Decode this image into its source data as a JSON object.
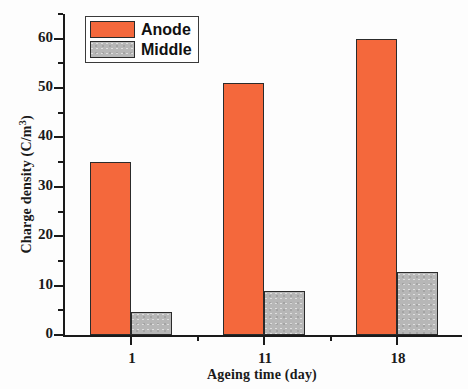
{
  "chart_data": {
    "type": "bar",
    "title": "",
    "xlabel": "Ageing time (day)",
    "ylabel_text": "Charge density (C/m",
    "ylabel_sup": "3",
    "ylabel_tail": ")",
    "ylabel_full": "Charge density (C/m3)",
    "categories": [
      "1",
      "11",
      "18"
    ],
    "series": [
      {
        "name": "Anode",
        "color": "#f4683c",
        "values": [
          35,
          51,
          60
        ]
      },
      {
        "name": "Middle",
        "color": "#b7b7b7",
        "values": [
          4.7,
          9,
          12.8
        ]
      }
    ],
    "ylim": [
      0,
      65
    ],
    "xlim_note": "categorical, 3 groups",
    "y_major_ticks": [
      0,
      10,
      20,
      30,
      40,
      50,
      60
    ],
    "y_minor_ticks": [
      5,
      15,
      25,
      35,
      45,
      55,
      65
    ],
    "y_tick_labels": [
      "0",
      "10",
      "20",
      "30",
      "40",
      "50",
      "60"
    ],
    "x_tick_labels": [
      "1",
      "11",
      "18"
    ],
    "grid": false,
    "legend_position": "top-left inside axes",
    "legend_entries": [
      "Anode",
      "Middle"
    ]
  },
  "axes": {
    "y_ticks": [
      {
        "value": 60,
        "label": "60"
      },
      {
        "value": 50,
        "label": "50"
      },
      {
        "value": 40,
        "label": "40"
      },
      {
        "value": 30,
        "label": "30"
      },
      {
        "value": 20,
        "label": "20"
      },
      {
        "value": 10,
        "label": "10"
      },
      {
        "value": 0,
        "label": "0"
      }
    ],
    "y_minor": [
      65,
      55,
      45,
      35,
      25,
      15,
      5
    ],
    "x_ticks": [
      {
        "label": "1"
      },
      {
        "label": "11"
      },
      {
        "label": "18"
      }
    ]
  },
  "legend": {
    "rows": [
      {
        "label": "Anode",
        "swatch": "anode-swatch"
      },
      {
        "label": "Middle",
        "swatch": "middle-swatch"
      }
    ]
  }
}
